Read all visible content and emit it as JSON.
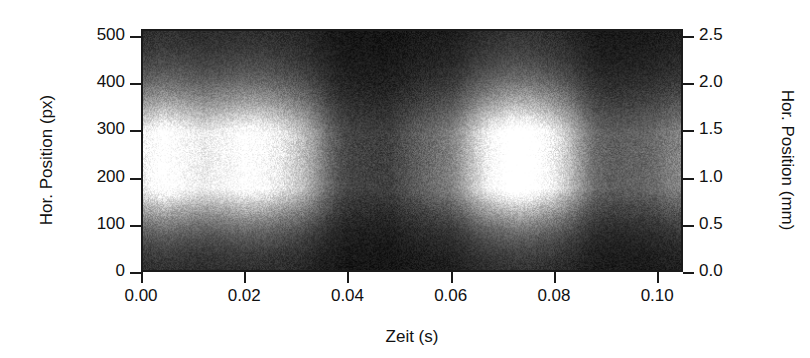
{
  "figure": {
    "kind": "grayscale-spatiotemporal-intensity-map",
    "background_color": "#ffffff",
    "frame_color": "#1a1a1a"
  },
  "chart_data": {
    "type": "heatmap",
    "title": "",
    "subtitle": "",
    "colormap": "grayscale",
    "colormap_low": "#000000",
    "colormap_high": "#ffffff",
    "grid": false,
    "legend": "none",
    "xlabel": "Zeit (s)",
    "ylabel": "Hor. Position (px)",
    "ylabel_right": "Hor. Position (mm)",
    "xlim": [
      0.0,
      0.105
    ],
    "ylim": [
      0,
      515
    ],
    "ylim_right": [
      0.0,
      2.575
    ],
    "xticks": [
      0.0,
      0.02,
      0.04,
      0.06,
      0.08,
      0.1
    ],
    "xticklabels": [
      "0.00",
      "0.02",
      "0.04",
      "0.06",
      "0.08",
      "0.10"
    ],
    "yticks": [
      0,
      100,
      200,
      300,
      400,
      500
    ],
    "yticklabels": [
      "0",
      "100",
      "200",
      "300",
      "400",
      "500"
    ],
    "yticks_right": [
      0.0,
      0.5,
      1.0,
      1.5,
      2.0,
      2.5
    ],
    "yticklabels_right": [
      "0.0",
      "0.5",
      "1.0",
      "1.5",
      "2.0",
      "2.5"
    ],
    "x_unit": "s",
    "y_unit_left": "px",
    "y_unit_right": "mm",
    "px_per_mm": 200,
    "noise": {
      "type": "film-grain",
      "amplitude": 0.16
    },
    "band": {
      "center_px": 230,
      "sigma_px": 62,
      "upper_tail_px": 95,
      "lower_tail_px": 78
    },
    "envelope": {
      "comment": "Peak brightness of the emission band versus time (0-1 scale).",
      "t": [
        0.0,
        0.004,
        0.008,
        0.012,
        0.016,
        0.02,
        0.024,
        0.028,
        0.032,
        0.036,
        0.04,
        0.044,
        0.048,
        0.052,
        0.056,
        0.06,
        0.064,
        0.068,
        0.072,
        0.076,
        0.08,
        0.084,
        0.088,
        0.092,
        0.096,
        0.1
      ],
      "v": [
        0.88,
        1.0,
        0.92,
        0.84,
        0.9,
        0.97,
        0.93,
        0.8,
        0.66,
        0.52,
        0.45,
        0.48,
        0.44,
        0.5,
        0.55,
        0.62,
        0.78,
        0.92,
        0.99,
        0.95,
        0.86,
        0.7,
        0.55,
        0.48,
        0.46,
        0.44
      ]
    },
    "striations": {
      "comment": "Vertical bright/dark fringes: time centre (s), relative amplitude, width (s).",
      "centers": [
        0.037,
        0.0405,
        0.0432,
        0.0462,
        0.049,
        0.052,
        0.0552,
        0.0585,
        0.0615,
        0.0875,
        0.0905,
        0.0935,
        0.0965,
        0.0995
      ],
      "amplitudes": [
        0.3,
        0.42,
        0.38,
        0.46,
        0.4,
        0.36,
        0.32,
        0.28,
        0.22,
        0.26,
        0.3,
        0.28,
        0.24,
        0.2
      ],
      "width": 0.0042
    }
  },
  "axes": {
    "left": {
      "title": "Hor. Position (px)",
      "ticks": [
        {
          "value": 500,
          "label": "500"
        },
        {
          "value": 400,
          "label": "400"
        },
        {
          "value": 300,
          "label": "300"
        },
        {
          "value": 200,
          "label": "200"
        },
        {
          "value": 100,
          "label": "100"
        },
        {
          "value": 0,
          "label": "0"
        }
      ]
    },
    "right": {
      "title": "Hor. Position (mm)",
      "ticks": [
        {
          "value": 2.5,
          "label": "2.5"
        },
        {
          "value": 2.0,
          "label": "2.0"
        },
        {
          "value": 1.5,
          "label": "1.5"
        },
        {
          "value": 1.0,
          "label": "1.0"
        },
        {
          "value": 0.5,
          "label": "0.5"
        },
        {
          "value": 0.0,
          "label": "0.0"
        }
      ]
    },
    "bottom": {
      "title": "Zeit (s)",
      "ticks": [
        {
          "value": 0.0,
          "label": "0.00"
        },
        {
          "value": 0.02,
          "label": "0.02"
        },
        {
          "value": 0.04,
          "label": "0.04"
        },
        {
          "value": 0.06,
          "label": "0.06"
        },
        {
          "value": 0.08,
          "label": "0.08"
        },
        {
          "value": 0.1,
          "label": "0.10"
        }
      ]
    }
  }
}
